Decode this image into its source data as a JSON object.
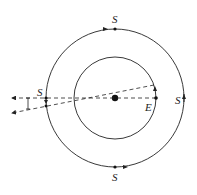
{
  "diagram": {
    "labels": {
      "sun_top": "S",
      "sun_left": "S",
      "sun_right": "S",
      "sun_bottom": "S",
      "earth": "E"
    },
    "colors": {
      "line": "#222222",
      "background": "#ffffff"
    }
  }
}
